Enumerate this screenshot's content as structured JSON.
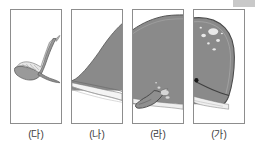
{
  "figure": {
    "panel_count": 4,
    "palette": {
      "body_gray": "#8a8a8a",
      "body_gray_dark": "#6f6f6f",
      "belly_white": "#f2f2f2",
      "outline": "#4a4a4a",
      "border": "#8d8d8d",
      "label_text": "#3b3b3b",
      "background": "#ffffff",
      "eye_black": "#1a1a1a",
      "spot_light": "#e8e8e8",
      "artifact_gray": "#c9c9c9"
    },
    "panels": [
      {
        "id": "panel-tail",
        "label": "(다)",
        "content": "whale tail fluke with two lobes and ridged shading",
        "order_in_image": 1
      },
      {
        "id": "panel-rear-body",
        "label": "(나)",
        "content": "tapering rear body with white belly band",
        "order_in_image": 2
      },
      {
        "id": "panel-mid-body",
        "label": "(라)",
        "content": "mid body with pectoral fin and light highlights",
        "order_in_image": 3
      },
      {
        "id": "panel-head",
        "label": "(가)",
        "content": "whale head with eye, mouth line and pale callosity spots",
        "order_in_image": 4
      }
    ]
  }
}
